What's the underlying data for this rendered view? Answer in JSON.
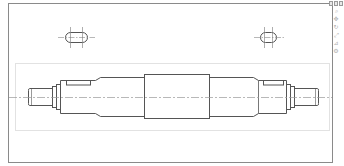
{
  "drawing": {
    "title": "Shaft drawing",
    "colors": {
      "outline": "#555555",
      "frame": "#8a8a8a",
      "inner_frame": "#e2e2e2",
      "centerline": "#9a9a9a",
      "background": "#ffffff"
    },
    "views": [
      {
        "name": "keyway-section-left",
        "type": "slot"
      },
      {
        "name": "keyway-section-right",
        "type": "slot"
      },
      {
        "name": "shaft-front-view",
        "type": "shaft"
      }
    ]
  },
  "toolbar": {
    "window_buttons": [
      "minimize",
      "maximize",
      "close"
    ],
    "tools": [
      {
        "icon": "zoom-icon",
        "glyph": "⌕"
      },
      {
        "icon": "pan-icon",
        "glyph": "✥"
      },
      {
        "icon": "rotate-icon",
        "glyph": "↻"
      },
      {
        "icon": "fit-icon",
        "glyph": "⤢"
      },
      {
        "icon": "measure-icon",
        "glyph": "⊿"
      },
      {
        "icon": "settings-icon",
        "glyph": "⚙"
      }
    ]
  }
}
